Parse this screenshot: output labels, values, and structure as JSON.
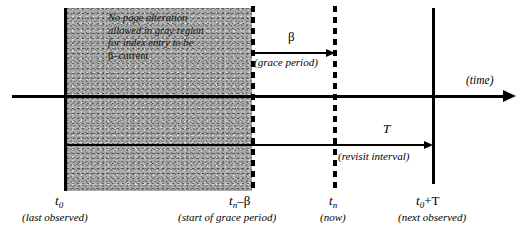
{
  "figure": {
    "background": "#ffffff",
    "gray_fill": "#a8a8a8"
  },
  "annotations": {
    "gray_note_line1": "No page alteration",
    "gray_note_line2": "allowed in gray region",
    "gray_note_line3": "for index entry to be",
    "gray_note_line4": "β–current"
  },
  "measures": {
    "beta_symbol": "β",
    "beta_caption": "(grace period)",
    "t_symbol": "T",
    "t_caption": "(revisit interval)"
  },
  "axis": {
    "time_caption": "(time)"
  },
  "ticks": [
    {
      "name": "t0",
      "base": "t",
      "sub": "0",
      "suffix": "",
      "caption": "(last observed)"
    },
    {
      "name": "tn-beta",
      "base": "t",
      "sub": "n",
      "suffix": "–β",
      "caption": "(start of grace period)"
    },
    {
      "name": "tn",
      "base": "t",
      "sub": "n",
      "suffix": "",
      "caption": "(now)"
    },
    {
      "name": "t0+T",
      "base": "t",
      "sub": "0",
      "suffix": "+T",
      "caption": "(next observed)"
    }
  ],
  "footer": {
    "clipped_caption": ""
  }
}
